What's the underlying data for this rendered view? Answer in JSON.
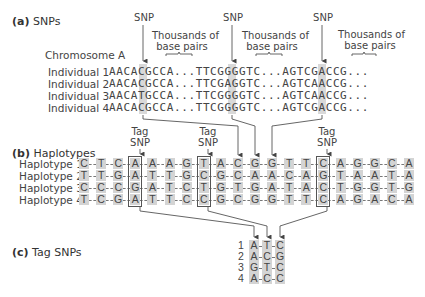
{
  "part_a": {
    "label_letter": "(a)",
    "label_text": "SNPs",
    "chromosome_label": "Chromosome A",
    "snp_label": "SNP",
    "gap_label_line1": "Thousands of",
    "gap_label_line2": "base pairs",
    "individuals": [
      {
        "label": "Individual  1",
        "seg1": "AACAC",
        "snp1": "C",
        "seg1b": "GCCA...TTCGG",
        "snp2": "G",
        "seg2b": "GGTC...AGTC",
        "snp3": "G",
        "seg3b": "ACCG..."
      },
      {
        "label": "Individual  2",
        "seg1": "AACAC",
        "snp1": "C",
        "seg1b": "GCCA...TTCGA",
        "snp2": "A",
        "seg2b": "GGTC...AGTC",
        "snp3": "A",
        "seg3b": "ACCG..."
      },
      {
        "label": "Individual  3",
        "seg1": "AACAT",
        "snp1": "T",
        "seg1b": "GCCA...TTCGG",
        "snp2": "G",
        "seg2b": "GGTC...AGTC",
        "snp3": "A",
        "seg3b": "ACCG..."
      },
      {
        "label": "Individual  4",
        "seg1": "AACAC",
        "snp1": "C",
        "seg1b": "GCCA...TTCGG",
        "snp2": "G",
        "seg2b": "GGTC...AGTC",
        "snp3": "G",
        "seg3b": "ACCG..."
      }
    ],
    "sequences": [
      "AACACGCCA...TTCGGGGTC...AGTCGACCG...",
      "AACACGCCA...TTCGAGGTC...AGTCAACCG...",
      "AACATGCCA...TTCGGGGTC...AGTCAACCG...",
      "AACACGCCA...TTCGGGGTC...AGTCGACCG..."
    ]
  },
  "part_b": {
    "label_letter": "(b)",
    "label_text": "Haplotypes",
    "tag_label_line1": "Tag",
    "tag_label_line2": "SNP",
    "haplotypes": [
      {
        "label": "Haplotype  1",
        "bases": [
          "C",
          "T",
          "C",
          "A",
          "A",
          "A",
          "G",
          "T",
          "A",
          "C",
          "G",
          "G",
          "T",
          "T",
          "C",
          "A",
          "G",
          "G",
          "C",
          "A"
        ]
      },
      {
        "label": "Haplotype  2",
        "bases": [
          "T",
          "T",
          "G",
          "A",
          "T",
          "T",
          "G",
          "C",
          "G",
          "C",
          "A",
          "A",
          "C",
          "A",
          "G",
          "T",
          "A",
          "A",
          "T",
          "A"
        ]
      },
      {
        "label": "Haplotype  3",
        "bases": [
          "C",
          "C",
          "C",
          "G",
          "A",
          "T",
          "C",
          "T",
          "G",
          "T",
          "G",
          "A",
          "T",
          "A",
          "C",
          "T",
          "G",
          "G",
          "T",
          "G"
        ]
      },
      {
        "label": "Haplotype  4",
        "bases": [
          "T",
          "C",
          "G",
          "A",
          "T",
          "T",
          "C",
          "C",
          "G",
          "C",
          "G",
          "G",
          "T",
          "T",
          "C",
          "A",
          "G",
          "A",
          "C",
          "A"
        ]
      }
    ],
    "tag_snp_columns": [
      4,
      8,
      15
    ],
    "snp_columns_from_a": [
      10,
      11,
      12
    ]
  },
  "part_c": {
    "label_letter": "(c)",
    "label_text": "Tag SNPs",
    "rows": [
      {
        "num": "1",
        "bases": [
          "A",
          "T",
          "C"
        ]
      },
      {
        "num": "2",
        "bases": [
          "A",
          "C",
          "G"
        ]
      },
      {
        "num": "3",
        "bases": [
          "G",
          "T",
          "C"
        ]
      },
      {
        "num": "4",
        "bases": [
          "A",
          "C",
          "C"
        ]
      }
    ]
  },
  "colors": {
    "shade": "#d4d4d4",
    "shade_dark": "#bdbdbd",
    "line": "#555555",
    "text": "#444444"
  }
}
